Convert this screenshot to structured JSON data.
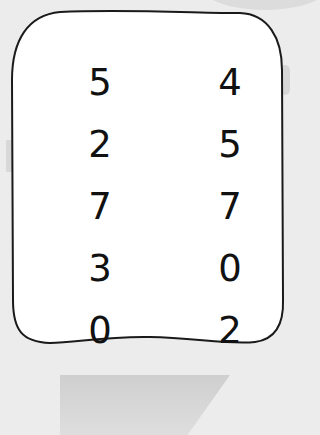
{
  "card": {
    "columns": 2,
    "rows": [
      {
        "left": "5",
        "right": "4"
      },
      {
        "left": "2",
        "right": "5"
      },
      {
        "left": "7",
        "right": "7"
      },
      {
        "left": "3",
        "right": "0"
      },
      {
        "left": "0",
        "right": "2"
      }
    ]
  },
  "colors": {
    "background": "#ececec",
    "card_fill": "#ffffff",
    "card_border": "#1a1a1a",
    "text": "#111111"
  }
}
